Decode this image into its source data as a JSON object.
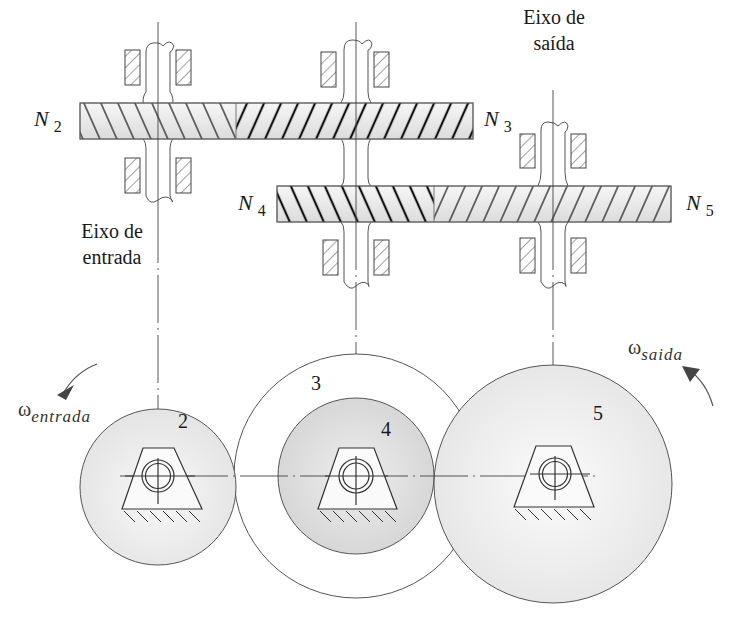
{
  "figure": {
    "gear_labels": {
      "N2": {
        "symbol": "N",
        "sub": "2"
      },
      "N3": {
        "symbol": "N",
        "sub": "3"
      },
      "N4": {
        "symbol": "N",
        "sub": "4"
      },
      "N5": {
        "symbol": "N",
        "sub": "5"
      }
    },
    "input_shaft": {
      "line1": "Eixo de",
      "line2": "entrada"
    },
    "output_shaft": {
      "line1": "Eixo de",
      "line2": "saída"
    },
    "omega_in": {
      "symbol": "ω",
      "sub": "entrada"
    },
    "omega_out": {
      "symbol": "ω",
      "sub": "saida"
    },
    "gear_numbers": [
      "2",
      "3",
      "4",
      "5"
    ],
    "colors": {
      "line": "#333333",
      "gear_fill_light": "#ebebeb",
      "gear_fill_dark": "#d8d8d8",
      "hatch_dark": "#111111",
      "hatch_light": "#444444"
    }
  }
}
